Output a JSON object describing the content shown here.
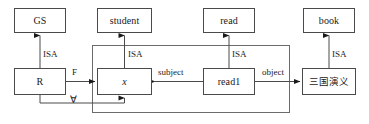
{
  "diagram": {
    "type": "entity-relationship-graph",
    "title": "",
    "stroke_color": "#4a4a4a",
    "text_color": "#1a1a1a",
    "background_color": "#ffffff",
    "nodes": [
      {
        "id": "gs",
        "label": "GS",
        "row": "top",
        "style": "plain"
      },
      {
        "id": "student",
        "label": "student",
        "row": "top",
        "style": "plain"
      },
      {
        "id": "read",
        "label": "read",
        "row": "top",
        "style": "plain"
      },
      {
        "id": "book",
        "label": "book",
        "row": "top",
        "style": "plain"
      },
      {
        "id": "r",
        "label": "R",
        "row": "bottom",
        "style": "plain"
      },
      {
        "id": "x",
        "label": "x",
        "row": "bottom",
        "style": "italic"
      },
      {
        "id": "read1",
        "label": "read1",
        "row": "bottom",
        "style": "plain"
      },
      {
        "id": "sanguo",
        "label": "三国演义",
        "row": "bottom",
        "style": "cjk"
      }
    ],
    "edges": [
      {
        "id": "isa-r-gs",
        "label": "ISA",
        "from": "r",
        "to": "gs",
        "arrow": "filled"
      },
      {
        "id": "isa-x-student",
        "label": "ISA",
        "from": "x",
        "to": "student",
        "arrow": "filled"
      },
      {
        "id": "isa-read1-read",
        "label": "ISA",
        "from": "read1",
        "to": "read",
        "arrow": "filled"
      },
      {
        "id": "isa-sanguo-book",
        "label": "ISA",
        "from": "sanguo",
        "to": "book",
        "arrow": "filled"
      },
      {
        "id": "f-r-x",
        "label": "F",
        "from": "r",
        "to": "x",
        "arrow": "filled"
      },
      {
        "id": "subject-read1-x",
        "label": "subject",
        "from": "read1",
        "to": "x",
        "arrow": "filled"
      },
      {
        "id": "object-read1-sanguo",
        "label": "object",
        "from": "read1",
        "to": "sanguo",
        "arrow": "filled"
      },
      {
        "id": "forall-loop",
        "label": "∀",
        "from": "r",
        "to": "x",
        "arrow": "filled"
      }
    ],
    "scope_box": {
      "id": "universal-scope-box",
      "label": "",
      "contains": [
        "x",
        "read1"
      ]
    },
    "labels": {
      "isa_1": "ISA",
      "isa_2": "ISA",
      "isa_3": "ISA",
      "isa_4": "ISA",
      "f": "F",
      "subject": "subject",
      "object": "object",
      "forall": "∀"
    }
  }
}
